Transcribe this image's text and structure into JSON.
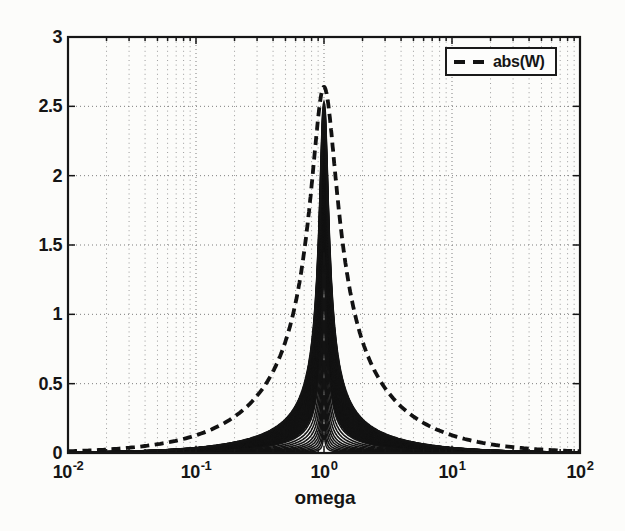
{
  "figure": {
    "background": "#fcfcfa",
    "ink": "#151515",
    "grid_color": "#8a8a8a"
  },
  "axes": {
    "xlabel": "omega",
    "x_ticks": [
      {
        "base": "10",
        "exp": "-2"
      },
      {
        "base": "10",
        "exp": "-1"
      },
      {
        "base": "10",
        "exp": "0"
      },
      {
        "base": "10",
        "exp": "1"
      },
      {
        "base": "10",
        "exp": "2"
      }
    ],
    "y_ticks": [
      "3",
      "2.5",
      "2",
      "1.5",
      "1",
      "0.5",
      "0"
    ]
  },
  "legend": {
    "label": "abs(W)"
  },
  "chart_data": {
    "type": "line",
    "x_scale": "log",
    "x_range": [
      0.01,
      100
    ],
    "y_range": [
      0,
      3
    ],
    "xlabel": "omega",
    "ylabel": "",
    "grid": true,
    "x_tick_labels": [
      "10^-2",
      "10^-1",
      "10^0",
      "10^1",
      "10^2"
    ],
    "y_tick_labels": [
      0,
      0.5,
      1,
      1.5,
      2,
      2.5,
      3
    ],
    "legend": {
      "position": "top-right",
      "entries": [
        {
          "label": "abs(W)",
          "style": "dashed"
        }
      ]
    },
    "series": [
      {
        "name": "abs(W)",
        "style": "dashed",
        "color": "#121212",
        "model": "second_order_bandpass_magnitude",
        "peak": 2.64,
        "peak_omega": 1,
        "zeta": 0.24,
        "points": [
          [
            0.01,
            0.013
          ],
          [
            0.02,
            0.025
          ],
          [
            0.05,
            0.064
          ],
          [
            0.1,
            0.128
          ],
          [
            0.2,
            0.263
          ],
          [
            0.3,
            0.413
          ],
          [
            0.5,
            0.805
          ],
          [
            0.7,
            1.452
          ],
          [
            0.85,
            2.183
          ],
          [
            1.0,
            2.64
          ],
          [
            1.2,
            2.098
          ],
          [
            1.5,
            1.318
          ],
          [
            2,
            0.805
          ],
          [
            3,
            0.468
          ],
          [
            5,
            0.263
          ],
          [
            10,
            0.128
          ],
          [
            20,
            0.064
          ],
          [
            50,
            0.025
          ],
          [
            100,
            0.013
          ]
        ]
      },
      {
        "name": "solid response family",
        "style": "solid",
        "color": "#131313",
        "model": "second_order_bandpass_magnitude",
        "peak_omega": 1,
        "dense_band": {
          "count": 45,
          "peak_range": [
            1.55,
            2.52
          ],
          "zeta_range": [
            0.042,
            0.072
          ]
        },
        "distinct_curves": [
          {
            "peak": 1.45,
            "zeta": 0.04
          },
          {
            "peak": 1.28,
            "zeta": 0.037
          },
          {
            "peak": 1.12,
            "zeta": 0.034
          },
          {
            "peak": 0.96,
            "zeta": 0.031
          },
          {
            "peak": 0.81,
            "zeta": 0.028
          },
          {
            "peak": 0.67,
            "zeta": 0.026
          },
          {
            "peak": 0.54,
            "zeta": 0.024
          },
          {
            "peak": 0.42,
            "zeta": 0.022
          },
          {
            "peak": 0.31,
            "zeta": 0.02
          },
          {
            "peak": 0.21,
            "zeta": 0.018
          },
          {
            "peak": 0.13,
            "zeta": 0.016
          }
        ]
      }
    ]
  }
}
